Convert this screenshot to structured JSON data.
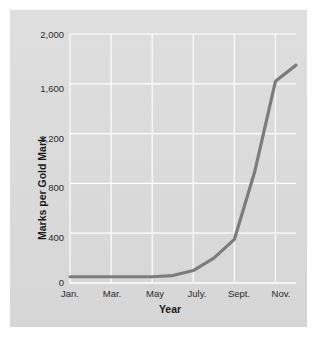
{
  "chart_data": {
    "type": "line",
    "title": "",
    "xlabel": "Year",
    "ylabel": "Marks per Gold Mark",
    "ylim": [
      0,
      2000
    ],
    "grid": true,
    "legend": "none",
    "line_color": "#7c7c7c",
    "panel_color": "#dcdcdc",
    "gridline_color": "#ffffff",
    "y_ticks": [
      "0",
      "400",
      "800",
      "1,200",
      "1,600",
      "2,000"
    ],
    "y_tick_values": [
      0,
      400,
      800,
      1200,
      1600,
      2000
    ],
    "x_ticks": [
      "Jan.",
      "Mar.",
      "May",
      "July.",
      "Sept.",
      "Nov."
    ],
    "categories": [
      "Jan.",
      "Feb.",
      "Mar.",
      "Apr.",
      "May",
      "June",
      "July.",
      "Aug.",
      "Sept.",
      "Oct.",
      "Nov.",
      "Dec."
    ],
    "values": [
      50,
      50,
      50,
      50,
      50,
      60,
      100,
      200,
      350,
      900,
      1620,
      1750
    ],
    "series": [
      {
        "name": "Marks per Gold Mark",
        "values": [
          50,
          50,
          50,
          50,
          50,
          60,
          100,
          200,
          350,
          900,
          1620,
          1750
        ]
      }
    ],
    "annotations": []
  },
  "axes": {
    "y_title": "Marks per Gold Mark",
    "x_title": "Year"
  }
}
